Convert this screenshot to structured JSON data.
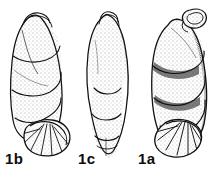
{
  "plate": {
    "title": "Foraminifera specimen plate",
    "background_color": "#ffffff",
    "ink_color": "#111111",
    "width": 213,
    "height": 171,
    "medium": "pen-and-ink stipple illustration",
    "figures": [
      {
        "label": "1b",
        "name": "specimen-1b",
        "view": "side view",
        "description": "Elongate club-shaped test, apex at top with flattened oblique apertural lip, spiral chamber sutures descending to the right, broad lobate basal chamber rosette at lower right",
        "position": {
          "x": 5,
          "y": 151
        }
      },
      {
        "label": "1c",
        "name": "specimen-1c",
        "view": "opposite side view",
        "description": "Narrow elongate test, large smooth ovate proloculus chamber at top, three to four progressively smaller chambers stacked downward, tapering pointed base",
        "position": {
          "x": 78,
          "y": 151
        }
      },
      {
        "label": "1a",
        "name": "specimen-1a",
        "view": "apertural view",
        "description": "Stout elongate test with looped apertural collar at upper right apex, strongly oblique overlapping chambers, large fan-shaped basal chamber cluster",
        "position": {
          "x": 138,
          "y": 151
        }
      }
    ]
  }
}
